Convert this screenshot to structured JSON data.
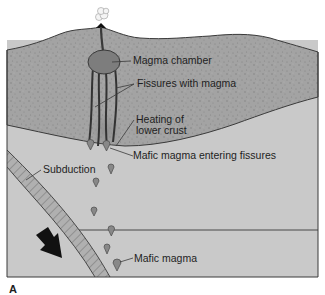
{
  "figure": {
    "panel_label": "A",
    "colors": {
      "upper_crust": "#a3a3a3",
      "lower_region": "#c9c9c9",
      "outline": "#3a3a3a",
      "magma": "#7d7d7d",
      "slab": "#b0b0b0",
      "arrow": "#111111",
      "text": "#1e1e1e"
    },
    "labels": {
      "magma_chamber": "Magma chamber",
      "fissures": "Fissures with magma",
      "heating_line1": "Heating of",
      "heating_line2": "lower crust",
      "mafic_entering": "Mafic magma entering fissures",
      "subduction": "Subduction",
      "mafic_magma": "Mafic magma"
    }
  }
}
